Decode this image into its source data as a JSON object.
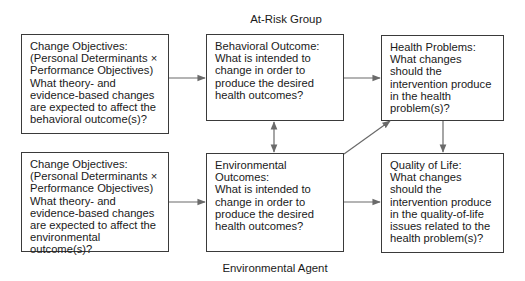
{
  "diagram": {
    "top_label": "At-Risk Group",
    "bottom_label": "Environmental Agent",
    "boxes": {
      "change_objectives_behavioral": {
        "title": "Change Objectives:",
        "body": "(Personal Determinants × Performance Objectives) What theory- and evidence-based changes are expected to affect the behavioral outcome(s)?"
      },
      "behavioral_outcome": {
        "title": "Behavioral Outcome:",
        "body": "What is intended to change in order to produce the desired health outcomes?"
      },
      "health_problems": {
        "title": "Health Problems:",
        "body": "What changes should the intervention produce in the health problem(s)?"
      },
      "change_objectives_environmental": {
        "title": "Change Objectives:",
        "body": "(Personal Determinants × Performance Objectives) What theory- and evidence-based changes are expected to affect the environmental outcome(s)?"
      },
      "environmental_outcomes": {
        "title": "Environmental Outcomes:",
        "body": "What is intended to change in order to produce the desired health outcomes?"
      },
      "quality_of_life": {
        "title": "Quality of Life:",
        "body": "What changes should the intervention produce in the quality-of-life issues related to the health problem(s)?"
      }
    },
    "connections": [
      {
        "from": "change_objectives_behavioral",
        "to": "behavioral_outcome",
        "type": "arrow"
      },
      {
        "from": "behavioral_outcome",
        "to": "health_problems",
        "type": "arrow"
      },
      {
        "from": "behavioral_outcome",
        "to": "environmental_outcomes",
        "type": "bidirectional"
      },
      {
        "from": "change_objectives_environmental",
        "to": "environmental_outcomes",
        "type": "arrow"
      },
      {
        "from": "environmental_outcomes",
        "to": "health_problems",
        "type": "arrow"
      },
      {
        "from": "environmental_outcomes",
        "to": "quality_of_life",
        "type": "arrow"
      },
      {
        "from": "health_problems",
        "to": "quality_of_life",
        "type": "arrow"
      }
    ],
    "colors": {
      "border": "#3a3a3a",
      "arrow": "#6a6a6a",
      "text": "#1a1a1a"
    }
  }
}
